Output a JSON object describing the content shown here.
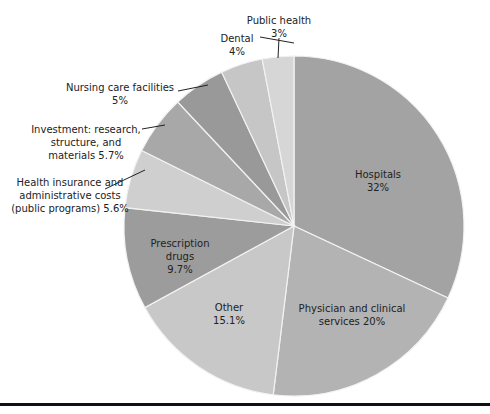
{
  "chart_data": {
    "type": "pie",
    "title": "",
    "start_angle_deg": 0,
    "direction": "clockwise",
    "slices": [
      {
        "name": "Hospitals",
        "value": 32,
        "label_lines": [
          "Hospitals",
          "32%"
        ],
        "color": "#a3a3a3",
        "label_inside": true
      },
      {
        "name": "Physician and clinical services",
        "value": 20,
        "label_lines": [
          "Physician and clinical",
          "services 20%"
        ],
        "color": "#b3b3b3",
        "label_inside": true
      },
      {
        "name": "Other",
        "value": 15.1,
        "label_lines": [
          "Other",
          "15.1%"
        ],
        "color": "#c8c8c8",
        "label_inside": true
      },
      {
        "name": "Prescription drugs",
        "value": 9.7,
        "label_lines": [
          "Prescription",
          "drugs",
          "9.7%"
        ],
        "color": "#9c9c9c",
        "label_inside": true
      },
      {
        "name": "Health insurance and administrative costs (public programs)",
        "value": 5.6,
        "label_lines": [
          "Health insurance and",
          "administrative costs",
          "(public programs) 5.6%"
        ],
        "color": "#cfcfcf",
        "label_inside": false
      },
      {
        "name": "Investment: research, structure, and materials",
        "value": 5.7,
        "label_lines": [
          "Investment: research,",
          "structure, and",
          "materials 5.7%"
        ],
        "color": "#a8a8a8",
        "label_inside": false
      },
      {
        "name": "Nursing care facilities",
        "value": 5,
        "label_lines": [
          "Nursing care facilities",
          "5%"
        ],
        "color": "#999999",
        "label_inside": false
      },
      {
        "name": "Dental",
        "value": 4,
        "label_lines": [
          "Dental",
          "4%"
        ],
        "color": "#c6c6c6",
        "label_inside": false
      },
      {
        "name": "Public health",
        "value": 3,
        "label_lines": [
          "Public health",
          "3%"
        ],
        "color": "#d6d6d6",
        "label_inside": false
      }
    ],
    "legend": null,
    "total_percent": 100.1
  },
  "layout": {
    "center": [
      294,
      226
    ],
    "radius": 170
  }
}
